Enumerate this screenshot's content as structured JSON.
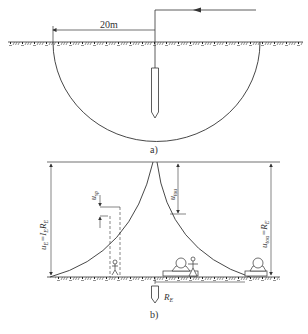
{
  "figure_a": {
    "distance_label": "20m",
    "caption": "a)"
  },
  "figure_b": {
    "caption": "b)",
    "labels": {
      "left_voltage": "u",
      "left_voltage_sub": "E",
      "left_voltage_eq": "=I",
      "left_voltage_eq_sub": "E",
      "left_voltage_r": "R",
      "left_voltage_r_sub": "E",
      "step_voltage": "u",
      "step_voltage_sub": "sp",
      "touch_voltage": "u",
      "touch_voltage_sub": "tou",
      "right_voltage": "u",
      "right_voltage_sub": "tou",
      "right_voltage_eq": "=R",
      "right_voltage_eq_sub": "E",
      "ground_resistance": "R",
      "ground_resistance_sub": "E"
    }
  },
  "colors": {
    "line": "#333333",
    "background": "#ffffff"
  }
}
